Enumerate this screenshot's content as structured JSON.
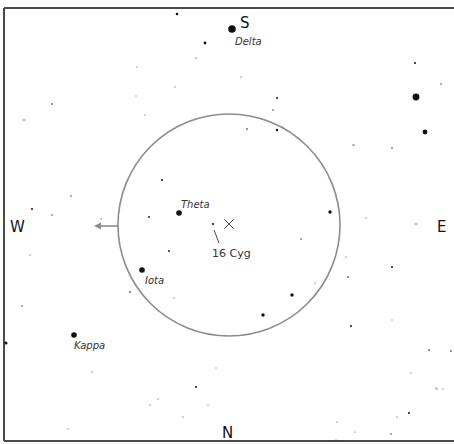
{
  "chart": {
    "width": 454,
    "height": 444,
    "frame": {
      "top": {
        "x1": 4,
        "y1": 8,
        "x2": 454,
        "y2": 8
      },
      "left": {
        "x1": 4,
        "y1": 8,
        "x2": 4,
        "y2": 441
      },
      "bottom": {
        "x1": 4,
        "y1": 441,
        "x2": 454,
        "y2": 441
      }
    },
    "field_of_view": {
      "cx": 229,
      "cy": 225,
      "r": 111
    },
    "center_marker": {
      "x": 229,
      "y": 224,
      "size": 4.5
    },
    "direction_arrow": {
      "x1": 118,
      "y1": 226,
      "x2": 94,
      "y2": 226
    },
    "cardinals": [
      {
        "id": "S",
        "label": "S",
        "x": 240,
        "y": 28
      },
      {
        "id": "W",
        "label": "W",
        "x": 10,
        "y": 232
      },
      {
        "id": "E",
        "label": "E",
        "x": 437,
        "y": 232
      },
      {
        "id": "N",
        "label": "N",
        "x": 222,
        "y": 438
      }
    ],
    "named_stars": [
      {
        "name": "Delta",
        "x": 232,
        "y": 29,
        "r": 3.8,
        "label_x": 235,
        "label_y": 45
      },
      {
        "name": "Theta",
        "x": 179,
        "y": 213,
        "r": 2.8,
        "label_x": 181,
        "label_y": 208
      },
      {
        "name": "Iota",
        "x": 142,
        "y": 270,
        "r": 2.8,
        "label_x": 145,
        "label_y": 284
      },
      {
        "name": "Kappa",
        "x": 74,
        "y": 335,
        "r": 2.8,
        "label_x": 74,
        "label_y": 349
      }
    ],
    "target": {
      "name": "16 Cyg",
      "x": 213,
      "y": 224,
      "r": 1.1,
      "pointer": {
        "x1": 214,
        "y1": 230,
        "x2": 219,
        "y2": 243
      },
      "label_x": 212,
      "label_y": 257
    },
    "stars": [
      {
        "x": 177,
        "y": 14,
        "r": 1.3
      },
      {
        "x": 205,
        "y": 43,
        "r": 1.4
      },
      {
        "x": 196,
        "y": 58,
        "r": 0.6
      },
      {
        "x": 241,
        "y": 77,
        "r": 0.5
      },
      {
        "x": 415,
        "y": 63,
        "r": 1.0
      },
      {
        "x": 441,
        "y": 84,
        "r": 0.7
      },
      {
        "x": 416,
        "y": 97,
        "r": 3.4
      },
      {
        "x": 425,
        "y": 132,
        "r": 2.4
      },
      {
        "x": 353,
        "y": 145,
        "r": 0.6
      },
      {
        "x": 392,
        "y": 148,
        "r": 0.7
      },
      {
        "x": 277,
        "y": 98,
        "r": 1.0
      },
      {
        "x": 273,
        "y": 110,
        "r": 0.7
      },
      {
        "x": 247,
        "y": 129,
        "r": 0.8
      },
      {
        "x": 277,
        "y": 130,
        "r": 1.2
      },
      {
        "x": 283,
        "y": 127,
        "r": 0.5
      },
      {
        "x": 354,
        "y": 145,
        "r": 0.6
      },
      {
        "x": 137,
        "y": 67,
        "r": 0.5
      },
      {
        "x": 136,
        "y": 96,
        "r": 0.5
      },
      {
        "x": 52,
        "y": 104,
        "r": 0.8
      },
      {
        "x": 24,
        "y": 120,
        "r": 0.7
      },
      {
        "x": 145,
        "y": 115,
        "r": 0.5
      },
      {
        "x": 162,
        "y": 180,
        "r": 1.0
      },
      {
        "x": 175,
        "y": 87,
        "r": 0.5
      },
      {
        "x": 71,
        "y": 196,
        "r": 0.7
      },
      {
        "x": 32,
        "y": 209,
        "r": 1.0
      },
      {
        "x": 52,
        "y": 215,
        "r": 0.7
      },
      {
        "x": 101,
        "y": 219,
        "r": 0.6
      },
      {
        "x": 149,
        "y": 217,
        "r": 0.9
      },
      {
        "x": 330,
        "y": 212,
        "r": 1.7
      },
      {
        "x": 301,
        "y": 239,
        "r": 0.7
      },
      {
        "x": 366,
        "y": 218,
        "r": 0.5
      },
      {
        "x": 416,
        "y": 224,
        "r": 0.7
      },
      {
        "x": 346,
        "y": 257,
        "r": 0.5
      },
      {
        "x": 392,
        "y": 267,
        "r": 1.0
      },
      {
        "x": 348,
        "y": 277,
        "r": 0.8
      },
      {
        "x": 315,
        "y": 283,
        "r": 0.5
      },
      {
        "x": 292,
        "y": 295,
        "r": 1.7
      },
      {
        "x": 263,
        "y": 315,
        "r": 1.7
      },
      {
        "x": 169,
        "y": 251,
        "r": 0.9
      },
      {
        "x": 174,
        "y": 298,
        "r": 0.5
      },
      {
        "x": 130,
        "y": 292,
        "r": 0.8
      },
      {
        "x": 30,
        "y": 255,
        "r": 0.5
      },
      {
        "x": 22,
        "y": 306,
        "r": 0.7
      },
      {
        "x": 6,
        "y": 343,
        "r": 1.5
      },
      {
        "x": 351,
        "y": 326,
        "r": 1.0
      },
      {
        "x": 392,
        "y": 320,
        "r": 0.5
      },
      {
        "x": 429,
        "y": 350,
        "r": 0.8
      },
      {
        "x": 451,
        "y": 351,
        "r": 0.8
      },
      {
        "x": 411,
        "y": 373,
        "r": 0.5
      },
      {
        "x": 436,
        "y": 388,
        "r": 0.6
      },
      {
        "x": 443,
        "y": 389,
        "r": 0.5
      },
      {
        "x": 92,
        "y": 372,
        "r": 0.6
      },
      {
        "x": 196,
        "y": 387,
        "r": 1.0
      },
      {
        "x": 158,
        "y": 399,
        "r": 0.5
      },
      {
        "x": 216,
        "y": 368,
        "r": 0.5
      },
      {
        "x": 150,
        "y": 405,
        "r": 0.5
      },
      {
        "x": 68,
        "y": 429,
        "r": 0.5
      },
      {
        "x": 183,
        "y": 417,
        "r": 0.5
      },
      {
        "x": 208,
        "y": 405,
        "r": 0.5
      },
      {
        "x": 409,
        "y": 413,
        "r": 1.0
      },
      {
        "x": 397,
        "y": 417,
        "r": 0.5
      },
      {
        "x": 391,
        "y": 434,
        "r": 0.7
      },
      {
        "x": 337,
        "y": 422,
        "r": 0.5
      },
      {
        "x": 355,
        "y": 432,
        "r": 0.5
      },
      {
        "x": 336,
        "y": 440,
        "r": 0.5
      },
      {
        "x": 437,
        "y": 389,
        "r": 0.5
      }
    ]
  }
}
